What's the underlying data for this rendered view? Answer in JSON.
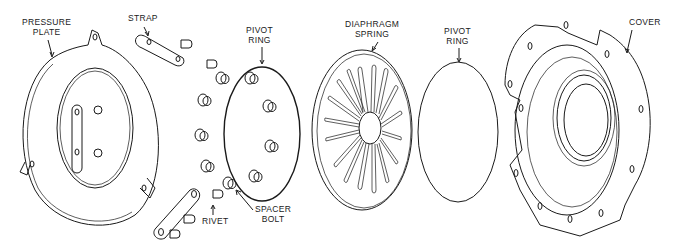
{
  "diagram": {
    "type": "exploded-view technical line drawing",
    "background_color": "#ffffff",
    "line_color": "#1a1a1a",
    "labels": {
      "pressure_plate": [
        "PRESSURE",
        "PLATE"
      ],
      "strap": "STRAP",
      "pivot_ring_1": [
        "PIVOT",
        "RING"
      ],
      "diaphragm_spring": [
        "DIAPHRAGM",
        "SPRING"
      ],
      "pivot_ring_2": [
        "PIVOT",
        "RING"
      ],
      "cover": "COVER",
      "rivet": "RIVET",
      "spacer_bolt": [
        "SPACER",
        "BOLT"
      ]
    },
    "components_left_to_right": [
      "pressure plate",
      "straps (2)",
      "rivets",
      "spacer bolts",
      "pivot ring",
      "diaphragm spring",
      "pivot ring",
      "cover"
    ]
  }
}
